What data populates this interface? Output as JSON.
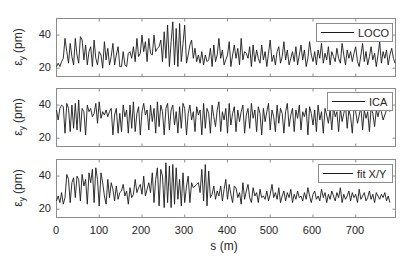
{
  "chart_data": [
    {
      "type": "line",
      "title": "",
      "xlabel": "s (m)",
      "ylabel": "ε_y (pm)",
      "xlim": [
        0,
        793
      ],
      "ylim": [
        15,
        50
      ],
      "yticks": [
        20,
        40
      ],
      "xticks": [
        0,
        100,
        200,
        300,
        400,
        500,
        600,
        700
      ],
      "legend": {
        "position": "upper right",
        "entries": [
          "LOCO"
        ]
      },
      "series": [
        {
          "name": "LOCO",
          "x_step": 10,
          "values": [
            21,
            23,
            21,
            24,
            26,
            38,
            30,
            23,
            35,
            27,
            22,
            38,
            28,
            23,
            39,
            37,
            25,
            34,
            22,
            30,
            33,
            21,
            37,
            26,
            22,
            30,
            28,
            20,
            36,
            25,
            32,
            22,
            27,
            35,
            22,
            28,
            33,
            21,
            21,
            30,
            22,
            21,
            29,
            30,
            26,
            33,
            24,
            38,
            27,
            29,
            40,
            30,
            36,
            24,
            38,
            29,
            28,
            40,
            30,
            32,
            33,
            37,
            24,
            42,
            26,
            46,
            21,
            36,
            48,
            22,
            44,
            21,
            47,
            24,
            35,
            46,
            23,
            28,
            34,
            37,
            26,
            32,
            24,
            28,
            23,
            30,
            22,
            28,
            24,
            25,
            32,
            21,
            34,
            24,
            28,
            38,
            26,
            31,
            22,
            25,
            28,
            36,
            21,
            28,
            34,
            26,
            32,
            22,
            38,
            25,
            30,
            29,
            26,
            33,
            21,
            34,
            24,
            31,
            26,
            23,
            34,
            25,
            30,
            21,
            29,
            37,
            24,
            28,
            22,
            30,
            33,
            23,
            27,
            36,
            25,
            31,
            22,
            26,
            30,
            24,
            33,
            22,
            28,
            34,
            25,
            31,
            21,
            26,
            36,
            28,
            24,
            30,
            22,
            31,
            26,
            35,
            23,
            29,
            25,
            33,
            22,
            30,
            27,
            24,
            32,
            26,
            23,
            35,
            28,
            22,
            31,
            26,
            30,
            24,
            29,
            33,
            24,
            21,
            28,
            35,
            24,
            30,
            22,
            27,
            33,
            25,
            29,
            21,
            28,
            36,
            23,
            30,
            26,
            31,
            22,
            28,
            32,
            26,
            23,
            30,
            35,
            24,
            29,
            22,
            27,
            33,
            25,
            28,
            24,
            26,
            22
          ]
        }
      ]
    },
    {
      "type": "line",
      "title": "",
      "xlabel": "s (m)",
      "ylabel": "ε_y (pm)",
      "xlim": [
        0,
        793
      ],
      "ylim": [
        15,
        50
      ],
      "yticks": [
        20,
        40
      ],
      "xticks": [
        0,
        100,
        200,
        300,
        400,
        500,
        600,
        700
      ],
      "legend": {
        "position": "upper right",
        "entries": [
          "ICA"
        ]
      },
      "series": [
        {
          "name": "ICA",
          "x_step": 10,
          "values": [
            37,
            31,
            38,
            40,
            39,
            23,
            41,
            38,
            24,
            40,
            26,
            41,
            25,
            43,
            24,
            38,
            36,
            22,
            40,
            36,
            38,
            33,
            35,
            41,
            29,
            42,
            32,
            36,
            34,
            37,
            33,
            36,
            38,
            22,
            34,
            38,
            23,
            35,
            24,
            40,
            33,
            37,
            23,
            40,
            26,
            42,
            24,
            35,
            39,
            22,
            36,
            41,
            34,
            37,
            25,
            40,
            30,
            38,
            23,
            42,
            27,
            40,
            36,
            22,
            38,
            41,
            25,
            37,
            40,
            28,
            36,
            23,
            39,
            26,
            41,
            38,
            22,
            35,
            40,
            31,
            36,
            24,
            39,
            34,
            37,
            22,
            41,
            26,
            38,
            35,
            23,
            40,
            33,
            27,
            37,
            42,
            24,
            36,
            31,
            38,
            23,
            41,
            28,
            35,
            39,
            24,
            37,
            30,
            36,
            40,
            23,
            34,
            38,
            26,
            41,
            32,
            37,
            24,
            39,
            35,
            22,
            38,
            30,
            36,
            41,
            25,
            37,
            33,
            24,
            40,
            29,
            38,
            35,
            23,
            36,
            41,
            27,
            34,
            38,
            24,
            37,
            32,
            40,
            25,
            36,
            33,
            38,
            22,
            39,
            35,
            28,
            37,
            24,
            40,
            31,
            36,
            23,
            38,
            34,
            29,
            37,
            25,
            39,
            33,
            36,
            24,
            38,
            30,
            35,
            40,
            26,
            37,
            33,
            23,
            38,
            36,
            29,
            34,
            39,
            25,
            37,
            32,
            36,
            24,
            38,
            35,
            27,
            37,
            33,
            38,
            36,
            31,
            34,
            37,
            38,
            36
          ]
        }
      ]
    },
    {
      "type": "line",
      "title": "",
      "xlabel": "s (m)",
      "ylabel": "ε_y (pm)",
      "xlim": [
        0,
        793
      ],
      "ylim": [
        15,
        50
      ],
      "yticks": [
        20,
        40
      ],
      "xticks": [
        0,
        100,
        200,
        300,
        400,
        500,
        600,
        700
      ],
      "legend": {
        "position": "upper right",
        "entries": [
          "fit X/Y"
        ]
      },
      "series": [
        {
          "name": "fit X/Y",
          "x_step": 10,
          "values": [
            25,
            28,
            24,
            30,
            23,
            27,
            41,
            38,
            24,
            36,
            39,
            27,
            40,
            38,
            25,
            41,
            34,
            38,
            23,
            42,
            36,
            44,
            24,
            45,
            38,
            22,
            42,
            36,
            28,
            23,
            38,
            27,
            36,
            32,
            25,
            34,
            26,
            30,
            31,
            35,
            28,
            31,
            23,
            33,
            27,
            29,
            38,
            30,
            33,
            35,
            29,
            40,
            28,
            32,
            36,
            30,
            42,
            24,
            38,
            45,
            22,
            44,
            40,
            21,
            48,
            24,
            46,
            21,
            47,
            23,
            45,
            26,
            38,
            22,
            42,
            24,
            34,
            40,
            24,
            36,
            33,
            34,
            35,
            36,
            30,
            44,
            25,
            47,
            22,
            43,
            27,
            29,
            34,
            26,
            31,
            28,
            34,
            25,
            32,
            38,
            26,
            35,
            29,
            24,
            34,
            33,
            27,
            30,
            23,
            36,
            26,
            31,
            35,
            27,
            24,
            33,
            28,
            30,
            24,
            32,
            27,
            28,
            26,
            31,
            25,
            29,
            35,
            27,
            30,
            26,
            33,
            24,
            28,
            31,
            25,
            30,
            27,
            32,
            24,
            29,
            26,
            31,
            27,
            28,
            25,
            30,
            26,
            33,
            28,
            24,
            29,
            31,
            26,
            28,
            25,
            32,
            27,
            30,
            24,
            29,
            26,
            31,
            28,
            25,
            30,
            27,
            33,
            24,
            29,
            26,
            28,
            31,
            25,
            30,
            27,
            29,
            24,
            32,
            26,
            28,
            30,
            25,
            27,
            31,
            26,
            29,
            24,
            30,
            28,
            26,
            29,
            27,
            30,
            25,
            28,
            24
          ]
        }
      ]
    }
  ],
  "axes": {
    "ylabel": "ε",
    "ylabel_sub": "y",
    "ylabel_unit": "(pm)",
    "xlabel": "s (m)",
    "ytick_labels": [
      "40",
      "20"
    ],
    "xtick_labels": [
      "0",
      "100",
      "200",
      "300",
      "400",
      "500",
      "600",
      "700"
    ]
  },
  "legends": [
    "LOCO",
    "ICA",
    "fit X/Y"
  ],
  "colors": {
    "trace": "#1a1a1a",
    "frame": "#8c8c8c",
    "text": "#262626",
    "background": "#ffffff"
  }
}
